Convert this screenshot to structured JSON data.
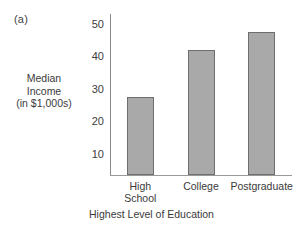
{
  "panel": {
    "label": "(a)"
  },
  "chart_data": {
    "type": "bar",
    "title": "",
    "panel_label": "(a)",
    "categories": [
      "High School",
      "College",
      "Postgraduate"
    ],
    "category_lines": [
      [
        "High",
        "School"
      ],
      [
        "College"
      ],
      [
        "Postgraduate"
      ]
    ],
    "values": [
      27.5,
      42,
      47.5
    ],
    "xlabel": "Highest Level of Education",
    "ylabel": "Median Income (in $1,000s)",
    "ylabel_lines": [
      "Median",
      "Income",
      "(in $1,000s)"
    ],
    "yticks": [
      10,
      20,
      30,
      40,
      50
    ],
    "ytick_labels": [
      "10",
      "20",
      "30",
      "40",
      "50"
    ],
    "ylim": [
      3.5,
      53
    ],
    "xlim": [
      0,
      3
    ],
    "grid": false,
    "legend": false,
    "bar_color": "#a9a9a9",
    "bar_edge_color": "#6e6e6e",
    "axis_color": "#8e8e8e"
  }
}
